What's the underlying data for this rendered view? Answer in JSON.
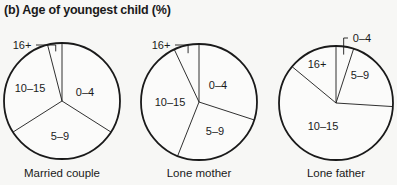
{
  "title": "(b) Age of youngest child (%)",
  "chart_data": [
    {
      "type": "pie",
      "title": "Married couple",
      "categories": [
        "0–4",
        "5–9",
        "10–15",
        "16+"
      ],
      "values": [
        34,
        32,
        30,
        4
      ],
      "center": [
        62,
        101
      ],
      "radius": 58,
      "label_pos": [
        [
          85,
          96
        ],
        [
          60,
          140
        ],
        [
          30,
          92
        ],
        [
          22,
          49
        ]
      ]
    },
    {
      "type": "pie",
      "title": "Lone mother",
      "categories": [
        "0–4",
        "5–9",
        "10–15",
        "16+"
      ],
      "values": [
        30,
        26,
        37,
        7
      ],
      "center": [
        199,
        102
      ],
      "radius": 58,
      "label_pos": [
        [
          218,
          89
        ],
        [
          215,
          135
        ],
        [
          170,
          106
        ],
        [
          161,
          49
        ]
      ]
    },
    {
      "type": "pie",
      "title": "Lone father",
      "categories": [
        "0–4",
        "5–9",
        "10–15",
        "16+"
      ],
      "values": [
        5,
        21,
        60,
        14
      ],
      "center": [
        336,
        103
      ],
      "radius": 57,
      "label_pos": [
        [
          362,
          42
        ],
        [
          360,
          79
        ],
        [
          323,
          130
        ],
        [
          317,
          68
        ]
      ]
    }
  ],
  "captions": [
    "Married couple",
    "Lone mother",
    "Lone father"
  ],
  "colors": {
    "stroke": "#1a1a1a",
    "fill": "#fbfbfa"
  }
}
